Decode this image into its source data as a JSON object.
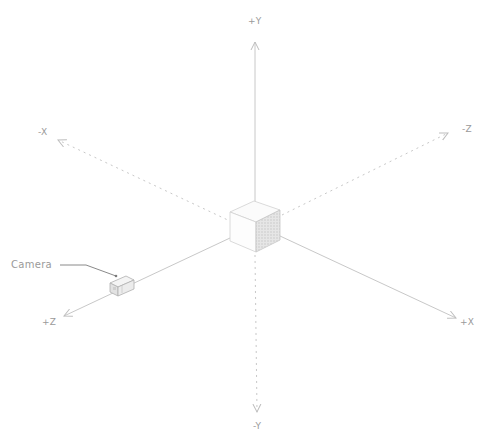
{
  "diagram": {
    "type": "3d-coordinate-axes",
    "axes": {
      "pos_y": {
        "label": "+Y",
        "style": "solid"
      },
      "neg_y": {
        "label": "-Y",
        "style": "dotted"
      },
      "pos_x": {
        "label": "+X",
        "style": "solid"
      },
      "neg_x": {
        "label": "-X",
        "style": "dotted"
      },
      "pos_z": {
        "label": "+Z",
        "style": "solid"
      },
      "neg_z": {
        "label": "-Z",
        "style": "dotted"
      }
    },
    "camera": {
      "label": "Camera",
      "icon": "camera-icon"
    },
    "center_object": {
      "icon": "cube-icon"
    },
    "colors": {
      "axis": "#c8c8c8",
      "label": "#9a9a9a",
      "cube_shade": "#d9d9d9"
    }
  }
}
